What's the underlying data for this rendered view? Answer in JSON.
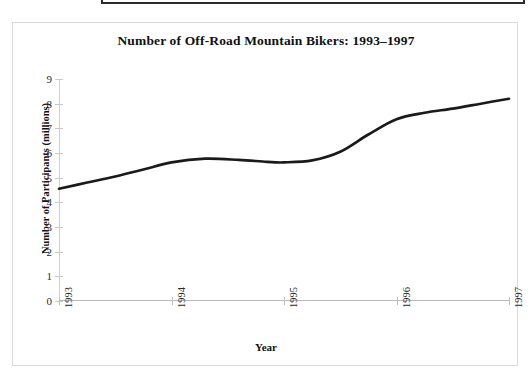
{
  "figure": {
    "title": "Number of Off-Road Mountain Bikers: 1993–1997",
    "x_axis_title": "Year",
    "y_axis_title": "Number of Participants (millions)",
    "line_color": "#1a1a1a",
    "frame_color": "#d9d9d9",
    "axis_color": "#c9c9c9"
  },
  "chart_data": {
    "type": "line",
    "title": "Number of Off-Road Mountain Bikers: 1993–1997",
    "xlabel": "Year",
    "ylabel": "Number of Participants (millions)",
    "xlim": [
      1993,
      1997
    ],
    "ylim": [
      0,
      9
    ],
    "grid": false,
    "legend": "none",
    "x_tick_labels": [
      "1993",
      "1994",
      "1995",
      "1996",
      "1997"
    ],
    "y_tick_labels": [
      "0",
      "1",
      "2",
      "3",
      "4",
      "5",
      "6",
      "7",
      "8",
      "9"
    ],
    "x_ticks": [
      1993,
      1994,
      1995,
      1996,
      1997
    ],
    "y_ticks": [
      0,
      1,
      2,
      3,
      4,
      5,
      6,
      7,
      8,
      9
    ],
    "series": [
      {
        "name": "Off-Road Mountain Bikers",
        "x": [
          1993,
          1994,
          1995,
          1996,
          1997
        ],
        "values": [
          4.6,
          5.7,
          5.6,
          7.4,
          8.2
        ],
        "units": "millions",
        "smoothed_points": [
          {
            "x": 1993.0,
            "y": 4.55
          },
          {
            "x": 1993.25,
            "y": 4.8
          },
          {
            "x": 1993.5,
            "y": 5.05
          },
          {
            "x": 1993.75,
            "y": 5.33
          },
          {
            "x": 1994.0,
            "y": 5.62
          },
          {
            "x": 1994.3,
            "y": 5.77
          },
          {
            "x": 1994.6,
            "y": 5.72
          },
          {
            "x": 1994.85,
            "y": 5.64
          },
          {
            "x": 1995.0,
            "y": 5.62
          },
          {
            "x": 1995.25,
            "y": 5.7
          },
          {
            "x": 1995.5,
            "y": 6.05
          },
          {
            "x": 1995.75,
            "y": 6.75
          },
          {
            "x": 1996.0,
            "y": 7.37
          },
          {
            "x": 1996.25,
            "y": 7.63
          },
          {
            "x": 1996.5,
            "y": 7.8
          },
          {
            "x": 1996.75,
            "y": 8.0
          },
          {
            "x": 1997.0,
            "y": 8.2
          }
        ]
      }
    ]
  }
}
